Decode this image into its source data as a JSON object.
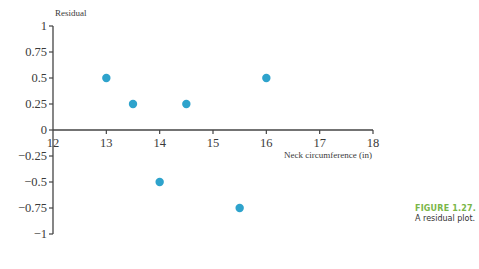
{
  "chart_data": {
    "type": "scatter",
    "title": "",
    "xlabel": "Neck circumference (in)",
    "ylabel": "Residual",
    "xlim": [
      12,
      18
    ],
    "ylim": [
      -1,
      1
    ],
    "x_ticks": [
      12,
      13,
      14,
      15,
      16,
      17,
      18
    ],
    "x_tick_labels": [
      "12",
      "13",
      "14",
      "15",
      "16",
      "17",
      "18"
    ],
    "y_ticks": [
      1,
      0.75,
      0.5,
      0.25,
      0,
      -0.25,
      -0.5,
      -0.75,
      -1
    ],
    "y_tick_labels": [
      "1",
      "0.75",
      "0.5",
      "0.25",
      "0",
      "−0.25",
      "−0.5",
      "−0.75",
      "−1"
    ],
    "grid": false,
    "legend": null,
    "series": [
      {
        "name": "Residuals",
        "color": "#2ea3cc",
        "points": [
          {
            "x": 13,
            "y": 0.5
          },
          {
            "x": 13.5,
            "y": 0.25
          },
          {
            "x": 14,
            "y": -0.5
          },
          {
            "x": 14.5,
            "y": 0.25
          },
          {
            "x": 15.5,
            "y": -0.75
          },
          {
            "x": 16,
            "y": 0.5
          }
        ]
      }
    ]
  },
  "caption": {
    "figure_label": "FIGURE 1.27.",
    "text": "A residual plot."
  },
  "colors": {
    "point": "#2ea3cc",
    "axis": "#444444",
    "figure_label": "#7ab648"
  }
}
